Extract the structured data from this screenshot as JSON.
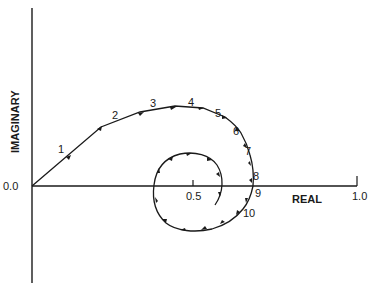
{
  "diagram": {
    "type": "complex-plane spiral (Nyquist-like locus)",
    "axes": {
      "x_label": "REAL",
      "y_label": "IMAGINARY",
      "origin_label": "0.0",
      "x_ticks": [
        {
          "value": 0.5,
          "label": "0.5"
        },
        {
          "value": 1.0,
          "label": "1.0"
        }
      ]
    },
    "point_labels": [
      "1",
      "2",
      "3",
      "4",
      "5",
      "6",
      "7",
      "8",
      "9",
      "10"
    ],
    "colors": {
      "ink": "#1a1a1a",
      "background": "#ffffff"
    }
  }
}
